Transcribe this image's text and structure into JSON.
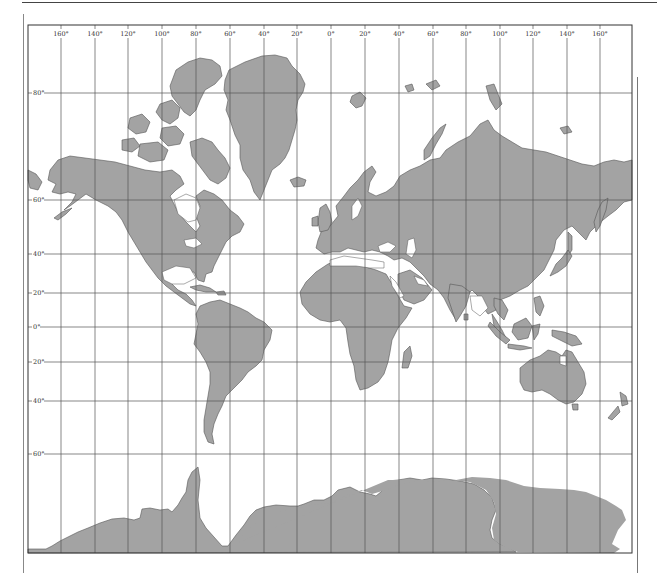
{
  "map": {
    "projection": "Mercator",
    "land_color": "#a3a3a3",
    "grid_color": "#555555",
    "frame_color": "#333333",
    "longitude_labels": [
      "160°",
      "140°",
      "120°",
      "100°",
      "80°",
      "60°",
      "40°",
      "20°",
      "0°",
      "20°",
      "40°",
      "60°",
      "80°",
      "100°",
      "120°",
      "140°",
      "160°"
    ],
    "latitude_labels": [
      "80°",
      "60°",
      "40°",
      "20°",
      "0°",
      "20°",
      "40°",
      "60°"
    ]
  }
}
